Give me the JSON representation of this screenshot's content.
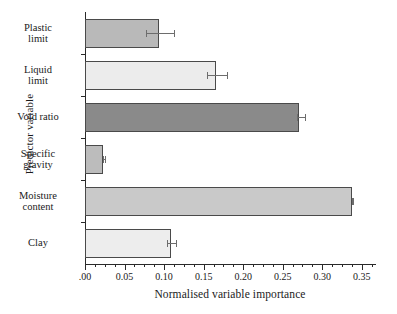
{
  "chart_data": {
    "type": "bar",
    "orientation": "horizontal",
    "title": "",
    "xlabel": "Normalised variable importance",
    "ylabel": "Predictor variable",
    "categories": [
      "Plastic\nlimit",
      "Liquid\nlimit",
      "Void ratio",
      "Specific\ngravity",
      "Moisture\ncontent",
      "Clay"
    ],
    "values": [
      0.094,
      0.166,
      0.271,
      0.023,
      0.338,
      0.109
    ],
    "errors_low": [
      0.017,
      0.012,
      0.003,
      0.0,
      0.0,
      0.005
    ],
    "errors_high": [
      0.019,
      0.014,
      0.007,
      0.002,
      0.001,
      0.006
    ],
    "bar_colors": [
      "#b9b9b9",
      "#ececec",
      "#8a8a8a",
      "#bcbcbc",
      "#c9c9c9",
      "#ededed"
    ],
    "bar_edge_color": "#4a4a4a",
    "error_color": "#6d6d6d",
    "xlim": [
      0.0,
      0.3667
    ],
    "xticks": [
      0.0,
      0.05,
      0.1,
      0.15,
      0.2,
      0.25,
      0.3,
      0.35
    ],
    "xticklabels": [
      ".00",
      "0.05",
      "0.10",
      "0.15",
      "0.20",
      "0.25",
      "0.30",
      "0.35"
    ],
    "xtick_minor_step": 0.0125,
    "grid": false,
    "legend": false
  },
  "axes": {
    "y_title": "Predictor variable",
    "x_title": "Normalised variable importance"
  }
}
